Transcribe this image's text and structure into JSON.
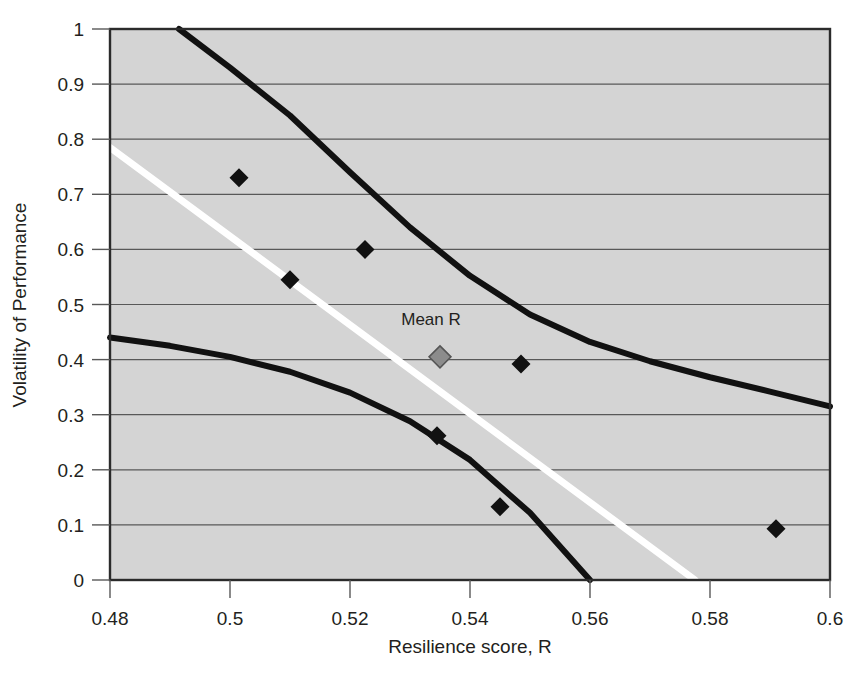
{
  "chart_data": {
    "type": "scatter",
    "title": "",
    "subtitle": "",
    "xlabel": "Resilience score, R",
    "ylabel": "Volatility of Performance",
    "xlim": [
      0.48,
      0.6
    ],
    "ylim": [
      0,
      1
    ],
    "grid": true,
    "grid_axis": "y",
    "legend": "none",
    "plot_background": "#d4d4d4",
    "xticks": [
      0.48,
      0.5,
      0.52,
      0.54,
      0.56,
      0.58,
      0.6
    ],
    "xtick_labels": [
      "0.48",
      "0.5",
      "0.52",
      "0.54",
      "0.56",
      "0.58",
      "0.6"
    ],
    "yticks": [
      0,
      0.1,
      0.2,
      0.3,
      0.4,
      0.5,
      0.6,
      0.7,
      0.8,
      0.9,
      1
    ],
    "ytick_labels": [
      "0",
      "0.1",
      "0.2",
      "0.3",
      "0.4",
      "0.5",
      "0.6",
      "0.7",
      "0.8",
      "0.9",
      "1"
    ],
    "series": [
      {
        "name": "observations",
        "type": "scatter",
        "marker": "diamond",
        "color": "#111111",
        "points": [
          {
            "x": 0.5015,
            "y": 0.73
          },
          {
            "x": 0.51,
            "y": 0.545
          },
          {
            "x": 0.5225,
            "y": 0.6
          },
          {
            "x": 0.5345,
            "y": 0.262
          },
          {
            "x": 0.545,
            "y": 0.133
          },
          {
            "x": 0.5485,
            "y": 0.392
          },
          {
            "x": 0.591,
            "y": 0.093
          }
        ]
      },
      {
        "name": "mean-r-marker",
        "type": "scatter",
        "marker": "diamond",
        "color": "#8c8c8c",
        "points": [
          {
            "x": 0.535,
            "y": 0.405
          }
        ]
      },
      {
        "name": "regression-line",
        "type": "line",
        "color": "#ffffff",
        "points": [
          {
            "x": 0.48,
            "y": 0.785
          },
          {
            "x": 0.5775,
            "y": 0.0
          }
        ]
      },
      {
        "name": "upper-confidence-band",
        "type": "line",
        "color": "#111111",
        "points": [
          {
            "x": 0.4915,
            "y": 1.0
          },
          {
            "x": 0.5,
            "y": 0.93
          },
          {
            "x": 0.51,
            "y": 0.843
          },
          {
            "x": 0.52,
            "y": 0.74
          },
          {
            "x": 0.53,
            "y": 0.64
          },
          {
            "x": 0.54,
            "y": 0.552
          },
          {
            "x": 0.55,
            "y": 0.482
          },
          {
            "x": 0.56,
            "y": 0.432
          },
          {
            "x": 0.57,
            "y": 0.397
          },
          {
            "x": 0.58,
            "y": 0.368
          },
          {
            "x": 0.59,
            "y": 0.342
          },
          {
            "x": 0.6,
            "y": 0.315
          }
        ]
      },
      {
        "name": "lower-confidence-band",
        "type": "line",
        "color": "#111111",
        "points": [
          {
            "x": 0.48,
            "y": 0.44
          },
          {
            "x": 0.49,
            "y": 0.425
          },
          {
            "x": 0.5,
            "y": 0.405
          },
          {
            "x": 0.51,
            "y": 0.378
          },
          {
            "x": 0.52,
            "y": 0.34
          },
          {
            "x": 0.53,
            "y": 0.288
          },
          {
            "x": 0.54,
            "y": 0.218
          },
          {
            "x": 0.55,
            "y": 0.122
          },
          {
            "x": 0.56,
            "y": 0.0
          }
        ]
      }
    ],
    "annotations": [
      {
        "text": "Mean R",
        "x": 0.5335,
        "y": 0.462
      }
    ]
  }
}
